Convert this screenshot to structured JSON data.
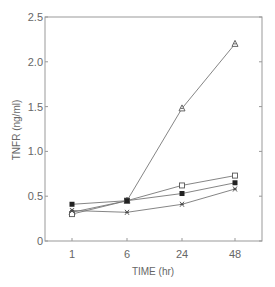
{
  "chart_data": {
    "type": "line",
    "title": "",
    "xlabel": "TIME (hr)",
    "ylabel": "TNFR (ng/ml)",
    "categories": [
      "1",
      "6",
      "24",
      "48"
    ],
    "ylim": [
      0,
      2.5
    ],
    "yticks": [
      "0",
      "0.5",
      "1.0",
      "1.5",
      "2.0",
      "2.5"
    ],
    "grid": false,
    "legend": "none",
    "series": [
      {
        "name": "open-triangle",
        "marker": "triangle",
        "values": [
          0.32,
          0.45,
          1.48,
          2.2
        ]
      },
      {
        "name": "open-square",
        "marker": "open-square",
        "values": [
          0.3,
          0.45,
          0.62,
          0.73
        ]
      },
      {
        "name": "filled-square",
        "marker": "filled-square",
        "values": [
          0.41,
          0.45,
          0.53,
          0.65
        ]
      },
      {
        "name": "cross",
        "marker": "cross",
        "values": [
          0.34,
          0.32,
          0.41,
          0.58
        ]
      }
    ]
  }
}
